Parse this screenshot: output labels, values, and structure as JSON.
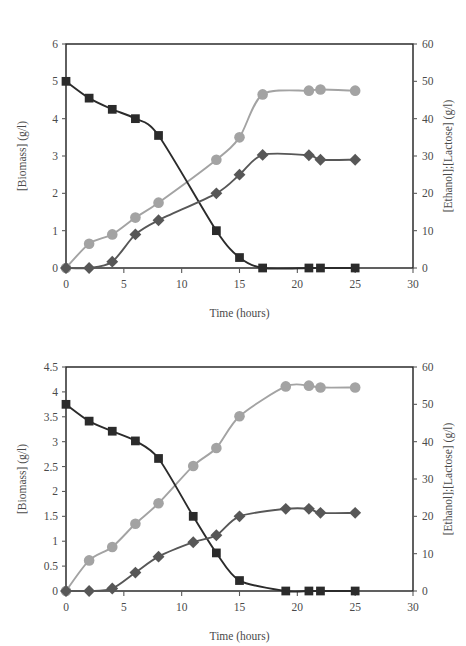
{
  "figure": {
    "title": "",
    "background": "#ffffff",
    "panel_labels": [
      "",
      ""
    ]
  },
  "colors": {
    "lactose": "#2b2b2b",
    "ethanol": "#a3a3a3",
    "biomass": "#575757",
    "axis": "#1d1d1d",
    "text": "#4a4a4a"
  },
  "legend_names": {
    "lactose": "lactose-squares-series",
    "ethanol": "ethanol-circles-series",
    "biomass": "biomass-diamonds-series"
  },
  "chart_data": [
    {
      "id": "top",
      "type": "line",
      "title": "",
      "xlabel": "Time (hours)",
      "ylabel": "[Biomass] (g/l)",
      "y2label": "[Ethanol];[Lactose] (g/l)",
      "xlim": [
        0,
        30
      ],
      "ylim": [
        0,
        6
      ],
      "y2lim": [
        0,
        60
      ],
      "xticks": [
        0,
        5,
        10,
        15,
        20,
        25,
        30
      ],
      "xticklabels": [
        "0",
        "5",
        "10",
        "15",
        "20",
        "25",
        "30"
      ],
      "yticks": [
        0,
        1,
        2,
        3,
        4,
        5,
        6
      ],
      "yticklabels": [
        "0",
        "1",
        "2",
        "3",
        "4",
        "5",
        "6"
      ],
      "y2ticks": [
        0,
        10,
        20,
        30,
        40,
        50,
        60
      ],
      "y2ticklabels": [
        "0",
        "10",
        "20",
        "30",
        "40",
        "50",
        "60"
      ],
      "grid": false,
      "legend_position": "none",
      "series": [
        {
          "name": "Lactose",
          "axis": "right",
          "marker": "square",
          "color": "#2b2b2b",
          "x": [
            0,
            2,
            4,
            6,
            8,
            13,
            15,
            17,
            21,
            22,
            25
          ],
          "y": [
            50.0,
            45.5,
            42.5,
            40.0,
            35.5,
            10.0,
            2.8,
            0.0,
            0.0,
            0.0,
            0.0
          ]
        },
        {
          "name": "Ethanol",
          "axis": "right",
          "marker": "circle",
          "color": "#a3a3a3",
          "x": [
            0,
            2,
            4,
            6,
            8,
            13,
            15,
            17,
            21,
            22,
            25
          ],
          "y": [
            0.0,
            6.5,
            9.0,
            13.5,
            17.5,
            29.0,
            35.0,
            46.5,
            47.5,
            47.8,
            47.5
          ]
        },
        {
          "name": "Biomass",
          "axis": "left",
          "marker": "diamond",
          "color": "#575757",
          "x": [
            0,
            2,
            4,
            6,
            8,
            13,
            15,
            17,
            21,
            22,
            25
          ],
          "y": [
            0.0,
            0.0,
            0.17,
            0.9,
            1.28,
            2.0,
            2.5,
            3.03,
            3.02,
            2.9,
            2.9
          ]
        }
      ]
    },
    {
      "id": "bottom",
      "type": "line",
      "title": "",
      "xlabel": "Time (hours)",
      "ylabel": "[Biomass] (g/l)",
      "y2label": "[Ethanol];[Lactose] (g/l)",
      "xlim": [
        0,
        30
      ],
      "ylim": [
        0,
        4.5
      ],
      "y2lim": [
        0,
        60
      ],
      "xticks": [
        0,
        5,
        10,
        15,
        20,
        25,
        30
      ],
      "xticklabels": [
        "0",
        "5",
        "10",
        "15",
        "20",
        "25",
        "30"
      ],
      "yticks": [
        0,
        0.5,
        1,
        1.5,
        2,
        2.5,
        3,
        3.5,
        4,
        4.5
      ],
      "yticklabels": [
        "0",
        "0.5",
        "1",
        "1.5",
        "2",
        "2.5",
        "3",
        "3.5",
        "4",
        "4.5"
      ],
      "y2ticks": [
        0,
        10,
        20,
        30,
        40,
        50,
        60
      ],
      "y2ticklabels": [
        "0",
        "10",
        "20",
        "30",
        "40",
        "50",
        "60"
      ],
      "grid": false,
      "legend_position": "none",
      "series": [
        {
          "name": "Lactose",
          "axis": "right",
          "marker": "square",
          "color": "#2b2b2b",
          "x": [
            0,
            2,
            4,
            6,
            8,
            11,
            13,
            15,
            19,
            21,
            22,
            25
          ],
          "y": [
            50.0,
            45.5,
            42.8,
            40.2,
            35.5,
            20.0,
            10.2,
            2.8,
            0.0,
            0.0,
            0.0,
            0.0
          ]
        },
        {
          "name": "Ethanol",
          "axis": "right",
          "marker": "circle",
          "color": "#a3a3a3",
          "x": [
            0,
            2,
            4,
            6,
            8,
            11,
            13,
            15,
            19,
            21,
            22,
            25
          ],
          "y": [
            0.0,
            8.2,
            11.8,
            18.0,
            23.5,
            33.5,
            38.3,
            46.8,
            54.8,
            55.0,
            54.5,
            54.5
          ]
        },
        {
          "name": "Biomass",
          "axis": "left",
          "marker": "diamond",
          "color": "#575757",
          "x": [
            0,
            2,
            4,
            6,
            8,
            11,
            13,
            15,
            19,
            21,
            22,
            25
          ],
          "y": [
            0.0,
            0.0,
            0.05,
            0.37,
            0.69,
            0.98,
            1.12,
            1.5,
            1.65,
            1.65,
            1.57,
            1.57
          ]
        }
      ]
    }
  ]
}
